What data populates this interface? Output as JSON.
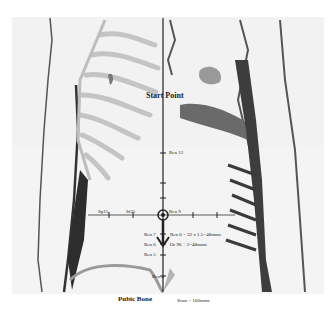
{
  "diagram": {
    "labels": {
      "start_point": "Start Point",
      "pubic_bone": "Pubic Bone",
      "ren12": "Ren 12",
      "ren9": "Ren 9",
      "ren7": "Ren 7",
      "ren6": "Ren 6",
      "ren5": "Ren 5",
      "ren4": "Ren 4",
      "sp15": "Sp15",
      "st25": "St25",
      "ren6_formula": "Ren 6 = 32 x 1.5=48mms",
      "dr_formula": "Or 96 ÷ 2=48mms",
      "scun": "Scun = 160mms"
    },
    "colors": {
      "line": "#222222",
      "bone": "#c8c8c8",
      "muscle": "#3a3a3a",
      "background": "#f2f2f2"
    }
  }
}
